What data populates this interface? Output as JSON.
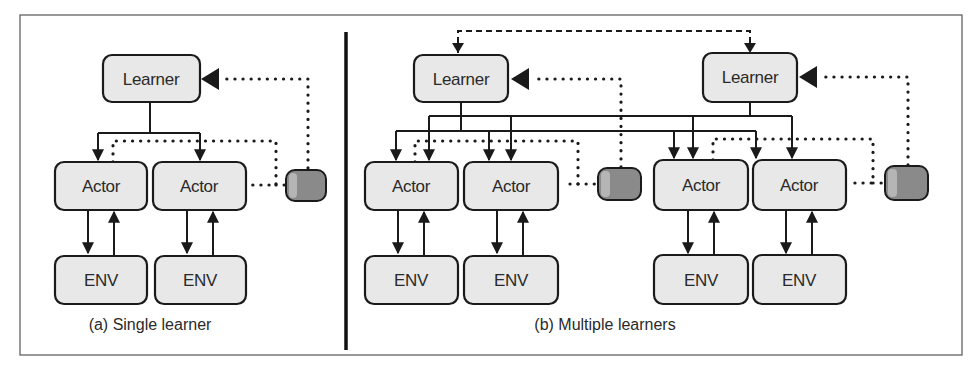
{
  "figure": {
    "panel_a": {
      "caption": "(a) Single learner",
      "learner": {
        "label": "Learner"
      },
      "actors": [
        {
          "label": "Actor"
        },
        {
          "label": "Actor"
        }
      ],
      "envs": [
        {
          "label": "ENV"
        },
        {
          "label": "ENV"
        }
      ],
      "buffer": {
        "icon": "replay-buffer-cylinder-icon"
      }
    },
    "panel_b": {
      "caption": "(b) Multiple learners",
      "learners": [
        {
          "label": "Learner"
        },
        {
          "label": "Learner"
        }
      ],
      "actors": [
        {
          "label": "Actor"
        },
        {
          "label": "Actor"
        },
        {
          "label": "Actor"
        },
        {
          "label": "Actor"
        }
      ],
      "envs": [
        {
          "label": "ENV"
        },
        {
          "label": "ENV"
        },
        {
          "label": "ENV"
        },
        {
          "label": "ENV"
        }
      ],
      "buffers": [
        {
          "icon": "replay-buffer-cylinder-icon"
        },
        {
          "icon": "replay-buffer-cylinder-icon"
        }
      ]
    },
    "colors": {
      "box_fill": "#e8e8e8",
      "stroke": "#1a1a1a",
      "buffer_fill": "#8a8a8a"
    }
  }
}
